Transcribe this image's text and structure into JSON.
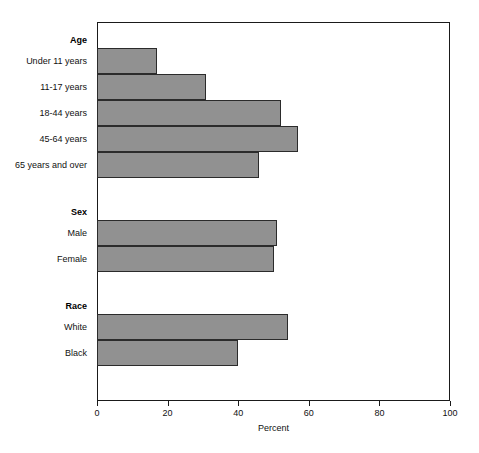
{
  "chart_data": {
    "type": "bar",
    "orientation": "horizontal",
    "title": "",
    "xlabel": "Percent",
    "ylabel": "",
    "xlim": [
      0,
      100
    ],
    "xticks": [
      0,
      20,
      40,
      60,
      80,
      100
    ],
    "grid": false,
    "legend": false,
    "bar_color": "#919191",
    "bar_edge_color": "#2b2b2b",
    "groups": [
      {
        "name": "Age",
        "categories": [
          "Under 11 years",
          "11-17 years",
          "18-44 years",
          "45-64 years",
          "65 years and over"
        ],
        "values": [
          17,
          31,
          52,
          57,
          46
        ]
      },
      {
        "name": "Sex",
        "categories": [
          "Male",
          "Female"
        ],
        "values": [
          51,
          50
        ]
      },
      {
        "name": "Race",
        "categories": [
          "White",
          "Black"
        ],
        "values": [
          54,
          40
        ]
      }
    ],
    "categories": [
      "Under 11 years",
      "11-17 years",
      "18-44 years",
      "45-64 years",
      "65 years and over",
      "Male",
      "Female",
      "White",
      "Black"
    ],
    "values": [
      17,
      31,
      52,
      57,
      46,
      51,
      50,
      54,
      40
    ]
  },
  "axis": {
    "x_title": "Percent",
    "tick_labels": [
      "0",
      "20",
      "40",
      "60",
      "80",
      "100"
    ]
  },
  "groups": [
    {
      "header": "Age"
    },
    {
      "header": "Sex"
    },
    {
      "header": "Race"
    }
  ]
}
